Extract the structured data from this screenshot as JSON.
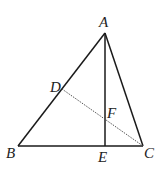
{
  "diagram": {
    "type": "geometry",
    "points": {
      "A": {
        "x": 105,
        "y": 33,
        "label": "A"
      },
      "B": {
        "x": 18,
        "y": 146,
        "label": "B"
      },
      "C": {
        "x": 143,
        "y": 146,
        "label": "C"
      },
      "D": {
        "x": 62,
        "y": 89,
        "label": "D"
      },
      "E": {
        "x": 105,
        "y": 146,
        "label": "E"
      },
      "F": {
        "x": 105,
        "y": 118,
        "label": "F"
      }
    },
    "segments": [
      {
        "from": "A",
        "to": "B",
        "style": "solid"
      },
      {
        "from": "A",
        "to": "C",
        "style": "solid"
      },
      {
        "from": "B",
        "to": "C",
        "style": "solid"
      },
      {
        "from": "A",
        "to": "E",
        "style": "solid"
      },
      {
        "from": "D",
        "to": "C",
        "style": "dotted"
      }
    ],
    "labels": {
      "A": "A",
      "B": "B",
      "C": "C",
      "D": "D",
      "E": "E",
      "F": "F"
    },
    "colors": {
      "line": "#1a1a1a",
      "dotted_line": "#555555",
      "background": "#ffffff"
    }
  }
}
